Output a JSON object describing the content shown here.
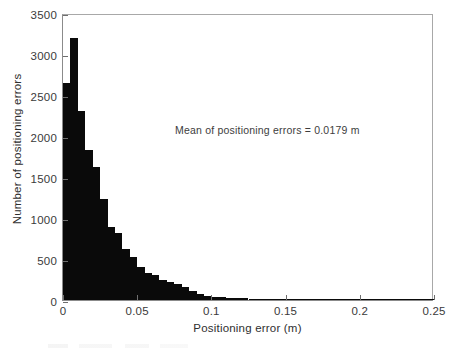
{
  "chart_data": {
    "type": "bar",
    "title": "",
    "subtitle": "",
    "xlabel": "Positioning error (m)",
    "ylabel": "Number of positioning errors",
    "xlim": [
      0,
      0.25
    ],
    "ylim": [
      0,
      3500
    ],
    "xticks": [
      0,
      0.05,
      0.1,
      0.15,
      0.2,
      0.25
    ],
    "xticklabels": [
      "0",
      "0.05",
      "0.1",
      "0.15",
      "0.2",
      "0.25"
    ],
    "yticks": [
      0,
      500,
      1000,
      1500,
      2000,
      2500,
      3000,
      3500
    ],
    "yticklabels": [
      "0",
      "500",
      "1000",
      "1500",
      "2000",
      "2500",
      "3000",
      "3500"
    ],
    "grid": false,
    "legend": null,
    "bar_color": "#0a0a0a",
    "bin_width": 0.005,
    "x": [
      0.0025,
      0.0075,
      0.0125,
      0.0175,
      0.0225,
      0.0275,
      0.0325,
      0.0375,
      0.0425,
      0.0475,
      0.0525,
      0.0575,
      0.0625,
      0.0675,
      0.0725,
      0.0775,
      0.0825,
      0.0875,
      0.0925,
      0.0975,
      0.1025,
      0.1075,
      0.1125,
      0.1175,
      0.1225,
      0.1275,
      0.1325,
      0.1375,
      0.1425,
      0.1475,
      0.1525,
      0.1575,
      0.1625,
      0.1675,
      0.1725,
      0.1775,
      0.1825,
      0.1875,
      0.1925,
      0.1975,
      0.2025,
      0.2075,
      0.2125,
      0.2175,
      0.2225,
      0.2275,
      0.2325,
      0.2375,
      0.2425,
      0.2475
    ],
    "categories": [
      "0.000-0.005",
      "0.005-0.010",
      "0.010-0.015",
      "0.015-0.020",
      "0.020-0.025",
      "0.025-0.030",
      "0.030-0.035",
      "0.035-0.040",
      "0.040-0.045",
      "0.045-0.050",
      "0.050-0.055",
      "0.055-0.060",
      "0.060-0.065",
      "0.065-0.070",
      "0.070-0.075",
      "0.075-0.080",
      "0.080-0.085",
      "0.085-0.090",
      "0.090-0.095",
      "0.095-0.100",
      "0.100-0.105",
      "0.105-0.110",
      "0.110-0.115",
      "0.115-0.120",
      "0.120-0.125",
      "0.125-0.130",
      "0.130-0.135",
      "0.135-0.140",
      "0.140-0.145",
      "0.145-0.150",
      "0.150-0.155",
      "0.155-0.160",
      "0.160-0.165",
      "0.165-0.170",
      "0.170-0.175",
      "0.175-0.180",
      "0.180-0.185",
      "0.185-0.190",
      "0.190-0.195",
      "0.195-0.200",
      "0.200-0.205",
      "0.205-0.210",
      "0.210-0.215",
      "0.215-0.220",
      "0.220-0.225",
      "0.225-0.230",
      "0.230-0.235",
      "0.235-0.240",
      "0.240-0.245",
      "0.245-0.250"
    ],
    "values": [
      2650,
      3200,
      2300,
      1830,
      1620,
      1230,
      890,
      820,
      620,
      520,
      400,
      330,
      300,
      250,
      215,
      195,
      160,
      110,
      75,
      55,
      40,
      34,
      28,
      24,
      20,
      17,
      14,
      12,
      10,
      9,
      8,
      7,
      6,
      5,
      5,
      4,
      4,
      3,
      3,
      3,
      2,
      2,
      2,
      2,
      1,
      1,
      1,
      1,
      1,
      1
    ],
    "annotations": [
      {
        "text": "Mean of positioning errors = 0.0179 m",
        "x": 0.0755,
        "y": 2170
      }
    ]
  },
  "axes": {
    "x_title": "Positioning error (m)",
    "y_title": "Number of positioning errors"
  },
  "annotation": {
    "mean_text": "Mean of positioning errors = 0.0179 m"
  }
}
